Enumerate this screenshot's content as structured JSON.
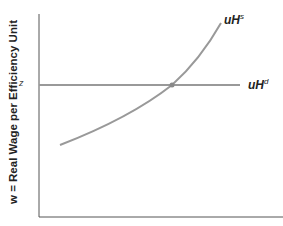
{
  "diagram": {
    "y_axis_label": "w = Real Wage per Efficiency Unit",
    "z_label": "z",
    "supply_curve": {
      "label_main": "uH",
      "label_sup": "s"
    },
    "demand_curve": {
      "label_main": "uH",
      "label_sup": "d"
    },
    "colors": {
      "curve": "#999999",
      "axis": "#555555",
      "point": "#888888"
    }
  }
}
